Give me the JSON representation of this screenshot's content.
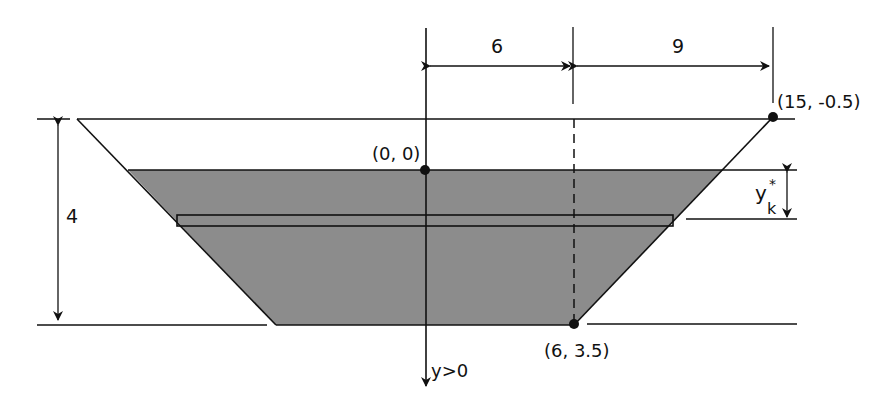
{
  "diagram": {
    "type": "trapezoidal trough cross-section with fluid and horizontal strip",
    "colors": {
      "fluid_fill": "#8c8c8c",
      "stroke": "#111111",
      "background": "#ffffff"
    },
    "dimensions": {
      "left_half_width": "6",
      "right_extra_width": "9",
      "height": "4",
      "strip_depth": "y",
      "strip_depth_sub": "k",
      "strip_depth_sup": "*"
    },
    "points": {
      "origin": "(0, 0)",
      "top_right": "(15, -0.5)",
      "bottom_right": "(6, 3.5)"
    },
    "axis": {
      "label": "y>0"
    }
  }
}
